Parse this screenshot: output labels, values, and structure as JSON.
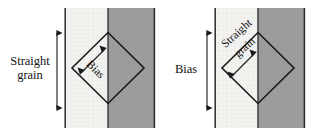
{
  "figure": {
    "background_color": "#ffffff",
    "width": 323,
    "height": 137
  },
  "colors": {
    "light_panel": "#f2f2f0",
    "dark_panel": "#9d9d9d",
    "grid_line": "#e2e2de",
    "outline": "#1a1a1a",
    "seam_line": "#2a2a2a",
    "text": "#111111"
  },
  "diagrams": [
    {
      "id": "left-diagram",
      "name": "straight-grain-diagram",
      "caption": "Diamond cut on the bias with straight grain running vertically",
      "panels": {
        "light": {
          "x": 65,
          "width": 43,
          "fill": "#f2f2f0"
        },
        "dark": {
          "x": 108,
          "width": 47,
          "fill": "#9d9d9d"
        },
        "top": 8,
        "bottom": 128
      },
      "vertical_arrow": {
        "label": "Straight grain",
        "label_line_1": "Straight",
        "label_line_2": "grain",
        "orientation": "vertical",
        "double_headed": true,
        "x": 57,
        "y_top": 28,
        "y_bottom": 113
      },
      "diamond": {
        "center_x": 108,
        "center_y": 68,
        "half_width": 36,
        "half_height": 36
      },
      "inner_arrow": {
        "label": "Bias",
        "orientation": "diagonal",
        "angle_deg": 45,
        "double_headed": true,
        "text_rotation_deg": 45
      }
    },
    {
      "id": "right-diagram",
      "name": "bias-diagram",
      "caption": "Diamond cut on the straight grain with bias running vertically",
      "panels": {
        "light": {
          "x": 215,
          "width": 43,
          "fill": "#f2f2f0"
        },
        "dark": {
          "x": 258,
          "width": 47,
          "fill": "#9d9d9d"
        },
        "top": 8,
        "bottom": 128
      },
      "vertical_arrow": {
        "label": "Bias",
        "orientation": "vertical",
        "double_headed": true,
        "x": 207,
        "y_top": 28,
        "y_bottom": 113
      },
      "diamond": {
        "center_x": 258,
        "center_y": 68,
        "half_width": 36,
        "half_height": 36
      },
      "inner_arrow": {
        "label": "Straight grain",
        "label_line_1": "Straight",
        "label_line_2": "grain",
        "orientation": "diagonal",
        "angle_deg": 45,
        "double_headed": true,
        "text_rotation_deg": -42
      }
    }
  ]
}
